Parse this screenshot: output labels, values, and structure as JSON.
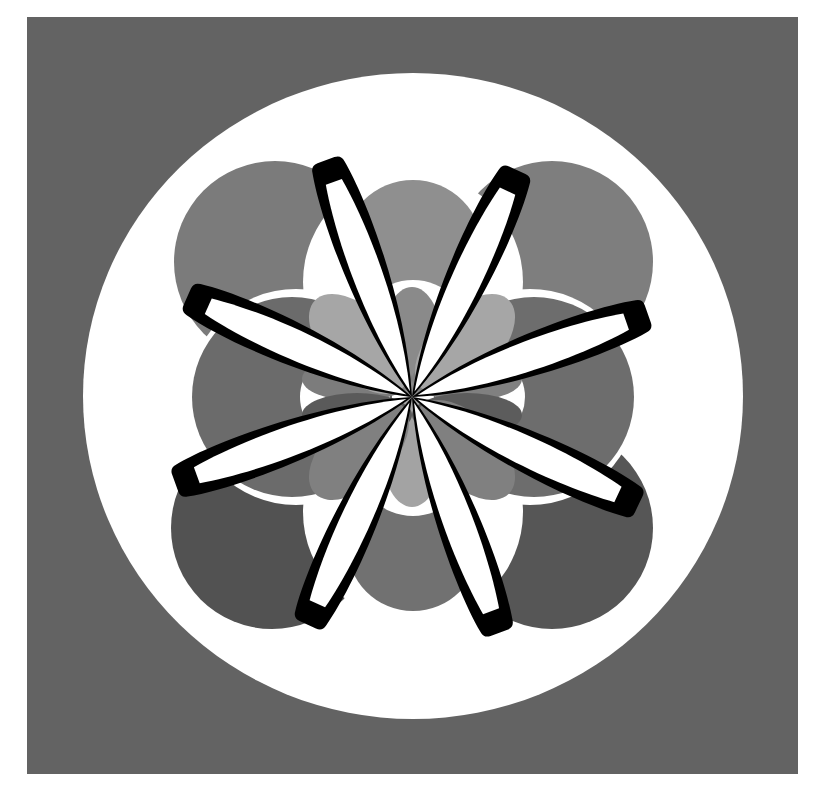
{
  "artwork": {
    "title": "Geometric eight-petal rosette",
    "canvas": {
      "width": 837,
      "height": 799
    },
    "colors": {
      "page": "#ffffff",
      "frame": "#636363",
      "disc": "#ffffff",
      "petal_stroke": "#000000",
      "petal_fill": "#ffffff",
      "corner_top_left": "#7b7b7b",
      "corner_top_right": "#7e7e7e",
      "corner_bottom_left": "#525252",
      "corner_bottom_right": "#565656",
      "side_left": "#6b6b6b",
      "side_right": "#6d6d6d",
      "top_circle": "#8f8f8f",
      "bottom_circle": "#717171",
      "inner_light": "#a3a3a3",
      "inner_mid": "#8a8a8a",
      "inner_dark": "#5a5a5a"
    },
    "frame": {
      "x": 27,
      "y": 17,
      "width": 771,
      "height": 757
    },
    "disc": {
      "cx": 413,
      "cy": 396,
      "rx": 330,
      "ry": 323
    },
    "center": {
      "x": 412,
      "y": 397
    },
    "petal_count": 8,
    "petal_tips": [
      {
        "x": 327,
        "y": 163
      },
      {
        "x": 516,
        "y": 173
      },
      {
        "x": 645,
        "y": 315
      },
      {
        "x": 636,
        "y": 503
      },
      {
        "x": 498,
        "y": 630
      },
      {
        "x": 309,
        "y": 622
      },
      {
        "x": 178,
        "y": 482
      },
      {
        "x": 190,
        "y": 298
      }
    ]
  }
}
